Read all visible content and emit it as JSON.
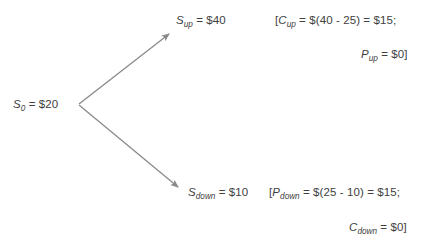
{
  "diagram": {
    "type": "binomial-option-tree",
    "stroke_color": "#808080",
    "text_color": "#404040",
    "background": "#ffffff",
    "nodes": [
      {
        "id": "root",
        "name": "initial-stock-price",
        "symbol": "S",
        "subscript": "0",
        "equals": " = $20",
        "value": 20,
        "x": 14,
        "y": 104
      },
      {
        "id": "up",
        "name": "up-stock-price",
        "symbol": "S",
        "subscript": "up",
        "equals": " = $40",
        "value": 40,
        "x": 176,
        "y": 20
      },
      {
        "id": "down",
        "name": "down-stock-price",
        "symbol": "S",
        "subscript": "down",
        "equals": " = $10",
        "value": 10,
        "x": 188,
        "y": 192
      }
    ],
    "edges": [
      {
        "id": "up-branch",
        "name": "up-branch-arrow",
        "x1": 79,
        "y1": 104,
        "x2": 172,
        "y2": 31
      },
      {
        "id": "down-branch",
        "name": "down-branch-arrow",
        "x1": 79,
        "y1": 105,
        "x2": 181,
        "y2": 190
      }
    ],
    "payoffs": [
      {
        "id": "call-up",
        "name": "call-payoff-up",
        "prefix": "[",
        "symbol": "C",
        "subscript": "up",
        "equals": " = $(40 - 25) = $15;",
        "value": 15
      },
      {
        "id": "put-up",
        "name": "put-payoff-up",
        "prefix": "",
        "symbol": "P",
        "subscript": "up",
        "equals": " = $0]",
        "value": 0
      },
      {
        "id": "put-down",
        "name": "put-payoff-down",
        "prefix": "[",
        "symbol": "P",
        "subscript": "down",
        "equals": " = $(25 - 10) = $15;",
        "value": 15
      },
      {
        "id": "call-down",
        "name": "call-payoff-down",
        "prefix": "",
        "symbol": "C",
        "subscript": "down",
        "equals": " = $0]",
        "value": 0
      }
    ]
  }
}
